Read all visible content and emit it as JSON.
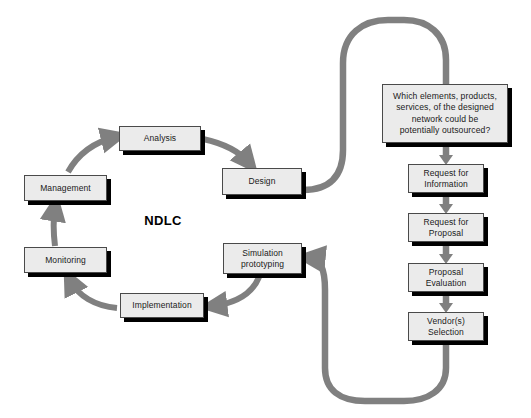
{
  "diagram": {
    "center_title": "NDLC",
    "colors": {
      "box_fill": "#ebebeb",
      "box_border": "#4a4a4a",
      "box_shadow": "#000000",
      "connector": "#808080",
      "cycle_arrow": "#808080",
      "text": "#1a1a1a",
      "background": "#ffffff"
    },
    "cycle_nodes": [
      {
        "id": "analysis",
        "label": "Analysis",
        "x": 119,
        "y": 126,
        "w": 82,
        "h": 25
      },
      {
        "id": "design",
        "label": "Design",
        "x": 222,
        "y": 168,
        "w": 80,
        "h": 27
      },
      {
        "id": "simulation",
        "label": "Simulation\nprototyping",
        "x": 223,
        "y": 243,
        "w": 79,
        "h": 31
      },
      {
        "id": "implementation",
        "label": "Implementation",
        "x": 120,
        "y": 293,
        "w": 84,
        "h": 25
      },
      {
        "id": "monitoring",
        "label": "Monitoring",
        "x": 24,
        "y": 247,
        "w": 83,
        "h": 26
      },
      {
        "id": "management",
        "label": "Management",
        "x": 24,
        "y": 175,
        "w": 83,
        "h": 26
      }
    ],
    "process_nodes": [
      {
        "id": "question",
        "label": "Which elements, products,\nservices, of the designed\nnetwork could be\npotentially outsourced?",
        "x": 382,
        "y": 84,
        "w": 126,
        "h": 59
      },
      {
        "id": "request-for-information",
        "label": "Request for\nInformation",
        "x": 408,
        "y": 164,
        "w": 76,
        "h": 29
      },
      {
        "id": "request-for-proposal",
        "label": "Request for\nProposal",
        "x": 408,
        "y": 213,
        "w": 76,
        "h": 29
      },
      {
        "id": "proposal-evaluation",
        "label": "Proposal\nEvaluation",
        "x": 408,
        "y": 263,
        "w": 76,
        "h": 29
      },
      {
        "id": "vendors-selection",
        "label": "Vendor(s)\nSelection",
        "x": 408,
        "y": 312,
        "w": 76,
        "h": 29
      }
    ],
    "connectors": [
      {
        "id": "design-to-question",
        "from": "design",
        "to": "question",
        "shape": "top-arch"
      },
      {
        "id": "vendors-to-simulation",
        "from": "vendors-selection",
        "to": "simulation",
        "shape": "bottom-arch"
      }
    ]
  }
}
